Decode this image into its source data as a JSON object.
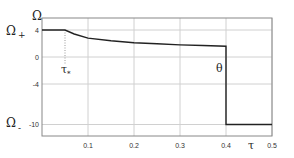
{
  "chart_data": {
    "type": "line",
    "title": "",
    "xlabel": "τ",
    "ylabel": "Ω",
    "xlim": [
      0,
      0.5
    ],
    "ylim": [
      -11.5,
      5.5
    ],
    "x_ticks": [
      "0.1",
      "0.2",
      "0.3",
      "0.4",
      "0.5"
    ],
    "y_ticks": [
      "4",
      "0",
      "-4",
      "-10"
    ],
    "grid": true,
    "annotations": [
      {
        "text": "Ω+",
        "at": "y=4",
        "position": "left of axis"
      },
      {
        "text": "Ω-",
        "at": "y=-10",
        "position": "left of axis"
      },
      {
        "text": "τ*",
        "at": "x=0.05",
        "position": "below dotted line"
      },
      {
        "text": "θ",
        "at": "x=0.4",
        "position": "left of vertical drop"
      }
    ],
    "series": [
      {
        "name": "Ω(τ)",
        "x": [
          0.0,
          0.05,
          0.07,
          0.1,
          0.15,
          0.2,
          0.25,
          0.3,
          0.35,
          0.4,
          0.4,
          0.5
        ],
        "values": [
          4,
          4,
          3.4,
          2.8,
          2.4,
          2.1,
          1.95,
          1.8,
          1.7,
          1.6,
          -10,
          -10
        ]
      }
    ],
    "tau_star": 0.05,
    "theta": 0.4
  },
  "labels": {
    "omega": "Ω",
    "omega_plus": "Ω",
    "plus_sub": "+",
    "omega_minus": "Ω",
    "minus_sub": "-",
    "tau": "τ",
    "tau_star": "τ",
    "star_sub": "*",
    "theta": "θ"
  }
}
